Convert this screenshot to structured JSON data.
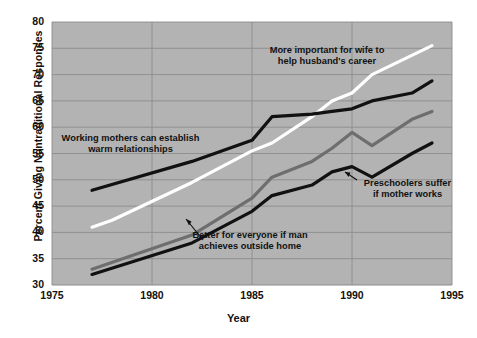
{
  "chart_data": {
    "type": "line",
    "title": "",
    "xlabel": "Year",
    "ylabel": "Percent Giving Nontraditional Responses",
    "xlim": [
      1975,
      1995
    ],
    "ylim": [
      30,
      80
    ],
    "xticks": [
      "1975",
      "1980",
      "1985",
      "1990",
      "1995"
    ],
    "yticks": [
      "30",
      "35",
      "40",
      "45",
      "50",
      "55",
      "60",
      "65",
      "70",
      "75",
      "80"
    ],
    "grid": true,
    "legend_position": "inline-annotations",
    "plot_background": "#b3b3b3",
    "gridline_color": "#8c8c8c",
    "series": [
      {
        "name": "More important for wife to help husband's career",
        "color": "#ffffff",
        "x": [
          1977,
          1978,
          1982,
          1985,
          1986,
          1988,
          1989,
          1990,
          1991,
          1994
        ],
        "values": [
          41.0,
          42.3,
          49.5,
          55.5,
          57.0,
          62.0,
          65.0,
          66.5,
          70.0,
          75.5
        ]
      },
      {
        "name": "Working mothers can establish warm relationships",
        "color": "#111111",
        "x": [
          1977,
          1982,
          1985,
          1986,
          1988,
          1989,
          1990,
          1991,
          1993,
          1994
        ],
        "values": [
          48.0,
          53.5,
          57.5,
          62.0,
          62.5,
          63.0,
          63.5,
          65.0,
          66.5,
          68.8
        ]
      },
      {
        "name": "Better for everyone if man achieves outside home",
        "color": "#6e6e6e",
        "x": [
          1977,
          1982,
          1985,
          1986,
          1988,
          1989,
          1990,
          1991,
          1993,
          1994
        ],
        "values": [
          33.0,
          39.5,
          46.5,
          50.5,
          53.5,
          56.0,
          59.0,
          56.5,
          61.5,
          63.0
        ]
      },
      {
        "name": "Preschoolers suffer if mother works",
        "color": "#111111",
        "x": [
          1977,
          1982,
          1985,
          1986,
          1988,
          1989,
          1990,
          1991,
          1993,
          1994
        ],
        "values": [
          32.0,
          38.0,
          44.0,
          47.0,
          49.0,
          51.5,
          52.5,
          50.5,
          55.0,
          57.0
        ]
      }
    ],
    "annotations": [
      {
        "id": "wife",
        "text": "More important for wife to\nhelp husband's career"
      },
      {
        "id": "working",
        "text": "Working mothers can establish\nwarm relationships"
      },
      {
        "id": "better",
        "text": "Better for everyone if man\nachieves outside home"
      },
      {
        "id": "pre",
        "text": "Preschoolers suffer\nif mother works"
      }
    ]
  }
}
